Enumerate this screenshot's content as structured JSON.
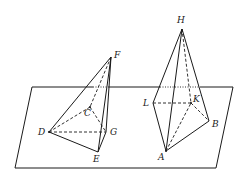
{
  "diagram": {
    "type": "geometry-3d",
    "plane": {
      "corners": [
        [
          32,
          87
        ],
        [
          233,
          87
        ],
        [
          216,
          168
        ],
        [
          15,
          168
        ]
      ]
    },
    "points": {
      "F": {
        "label": "F",
        "x": 111,
        "y": 57,
        "lx": 114,
        "ly": 51
      },
      "C": {
        "label": "C",
        "x": 90,
        "y": 107,
        "lx": 84,
        "ly": 109
      },
      "D": {
        "label": "D",
        "x": 49,
        "y": 132,
        "lx": 38,
        "ly": 128
      },
      "G": {
        "label": "G",
        "x": 106,
        "y": 132,
        "lx": 110,
        "ly": 128
      },
      "E": {
        "label": "E",
        "x": 98,
        "y": 152,
        "lx": 93,
        "ly": 155
      },
      "H": {
        "label": "H",
        "x": 182,
        "y": 29,
        "lx": 177,
        "ly": 16
      },
      "L": {
        "label": "L",
        "x": 153,
        "y": 103,
        "lx": 143,
        "ly": 99
      },
      "K": {
        "label": "K",
        "x": 191,
        "y": 103,
        "lx": 193,
        "ly": 95
      },
      "B": {
        "label": "B",
        "x": 209,
        "y": 121,
        "lx": 212,
        "ly": 120
      },
      "A": {
        "label": "A",
        "x": 166,
        "y": 151,
        "lx": 158,
        "ly": 153
      }
    },
    "pyramid1": {
      "apex": "F",
      "base": [
        "D",
        "E",
        "G",
        "C"
      ],
      "solid_edges": [
        [
          "F",
          "D"
        ],
        [
          "F",
          "E"
        ],
        [
          "D",
          "E"
        ],
        [
          "E",
          "G"
        ],
        [
          "F",
          "G"
        ]
      ],
      "hidden_edges": [
        [
          "D",
          "G"
        ],
        [
          "D",
          "C"
        ],
        [
          "C",
          "G"
        ],
        [
          "F",
          "C"
        ]
      ]
    },
    "pyramid2": {
      "apex": "H",
      "base": [
        "L",
        "A",
        "B",
        "K"
      ],
      "solid_edges": [
        [
          "H",
          "L"
        ],
        [
          "H",
          "A"
        ],
        [
          "H",
          "B"
        ],
        [
          "L",
          "A"
        ],
        [
          "A",
          "B"
        ]
      ],
      "hidden_edges": [
        [
          "L",
          "K"
        ],
        [
          "K",
          "B"
        ],
        [
          "A",
          "K"
        ],
        [
          "H",
          "K"
        ]
      ]
    }
  }
}
